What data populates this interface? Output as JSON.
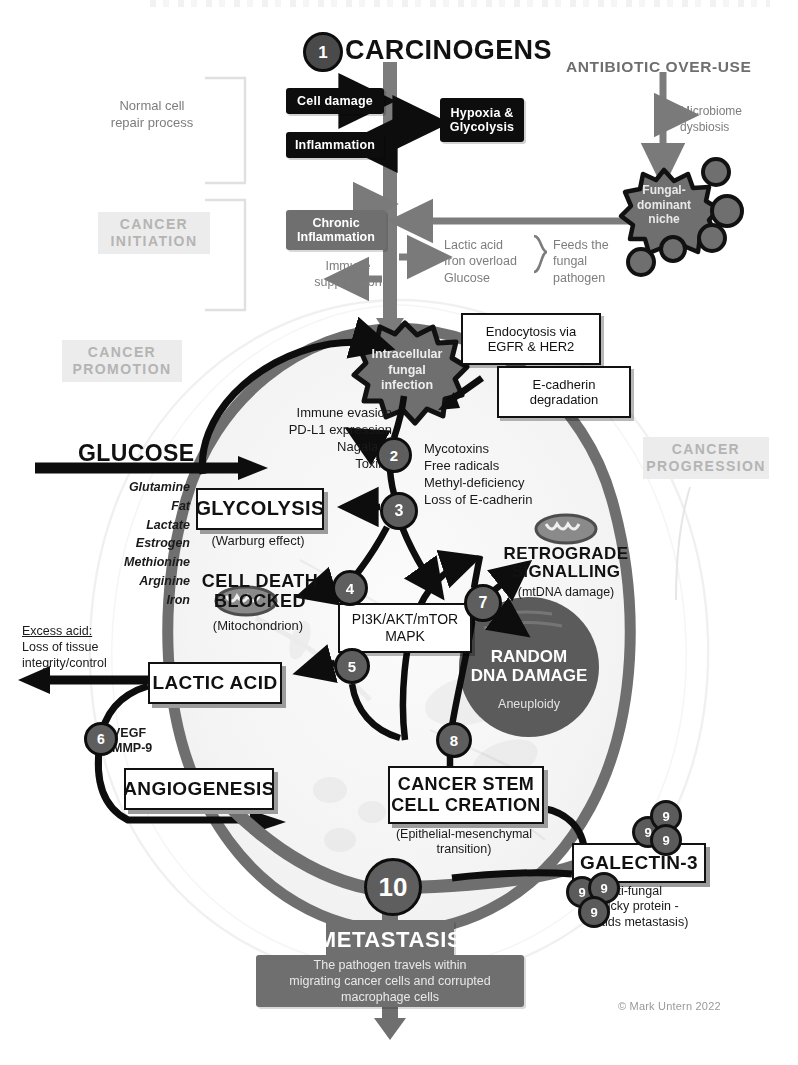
{
  "diagram": {
    "copyright": "© Mark Untern 2022",
    "colors": {
      "black": "#0d0d0d",
      "grey": "#6f6f6f",
      "node": "#5e5e5e",
      "ghost": "#b4b4b4",
      "membrane": "#6f6f6f",
      "nucleus": "#5b5b5b"
    }
  },
  "stage_labels": {
    "normal_repair": "Normal cell\nrepair process",
    "cancer_initiation": "CANCER\nINITIATION",
    "cancer_promotion": "CANCER\nPROMOTION",
    "cancer_progression": "CANCER\nPROGRESSION"
  },
  "headers": {
    "carcinogens": "CARCINOGENS",
    "antibiotic": "ANTIBIOTIC OVER-USE"
  },
  "top_boxes": {
    "cell_damage": "Cell damage",
    "inflammation": "Inflammation",
    "hypoxia": "Hypoxia &\nGlycolysis",
    "chronic_inflammation": "Chronic\nInflammation",
    "immune_suppression": "Immune\nsuppression",
    "microbiome": "Microbiome\ndysbiosis",
    "fungal_niche": "Fungal-\ndominant\nniche",
    "feeds_list": "Lactic acid\nIron overload\nGlucose",
    "feeds_the": "Feeds the\nfungal\npathogen"
  },
  "cell": {
    "fungal_infection": "Intracellular\nfungal\ninfection",
    "endocytosis": "Endocytosis via\nEGFR & HER2",
    "ecadherin": "E-cadherin\ndegradation",
    "immune_evasion": "Immune evasion\nPD-L1 expression\nNagalase\nToxins",
    "mycotoxins": "Mycotoxins\nFree radicals\nMethyl-deficiency\nLoss of E-cadherin",
    "glucose": "GLUCOSE",
    "nutrients": [
      "Glutamine",
      "Fat",
      "Lactate",
      "Estrogen",
      "Methionine",
      "Arginine",
      "Iron"
    ],
    "glycolysis": "GLYCOLYSIS",
    "warburg": "(Warburg effect)",
    "cell_death_blocked": "CELL DEATH\nBLOCKED",
    "mitochondrion": "(Mitochondrion)",
    "pathways": "PI3K/AKT/mTOR\nMAPK",
    "retrograde": "RETROGRADE\nSIGNALLING",
    "mtdna": "(mtDNA damage)",
    "random_dna": "RANDOM\nDNA DAMAGE",
    "aneuploidy": "Aneuploidy",
    "lactic_acid": "LACTIC ACID",
    "excess_acid_title": "Excess acid:",
    "excess_acid_body": "Loss of tissue\nintegrity/control",
    "vegf": "VEGF\nMMP-9",
    "angiogenesis": "ANGIOGENESIS",
    "cancer_stem": "CANCER STEM\nCELL CREATION",
    "emt": "(Epithelial-mesenchymal\ntransition)",
    "galectin": "GALECTIN-3",
    "galectin_note": "(Anti-fungal\nsticky protein -\naids metastasis)",
    "metastasis": "METASTASIS",
    "metastasis_note": "The pathogen travels within\nmigrating cancer cells and corrupted\nmacrophage cells"
  },
  "nodes": [
    {
      "id": "1",
      "label": "1"
    },
    {
      "id": "2",
      "label": "2"
    },
    {
      "id": "3",
      "label": "3"
    },
    {
      "id": "4",
      "label": "4"
    },
    {
      "id": "5",
      "label": "5"
    },
    {
      "id": "6",
      "label": "6"
    },
    {
      "id": "7",
      "label": "7"
    },
    {
      "id": "8",
      "label": "8"
    },
    {
      "id": "10",
      "label": "10"
    }
  ],
  "galectin_buds": [
    {
      "label": "9"
    },
    {
      "label": "9"
    },
    {
      "label": "9"
    },
    {
      "label": "9"
    },
    {
      "label": "9"
    },
    {
      "label": "9"
    }
  ]
}
